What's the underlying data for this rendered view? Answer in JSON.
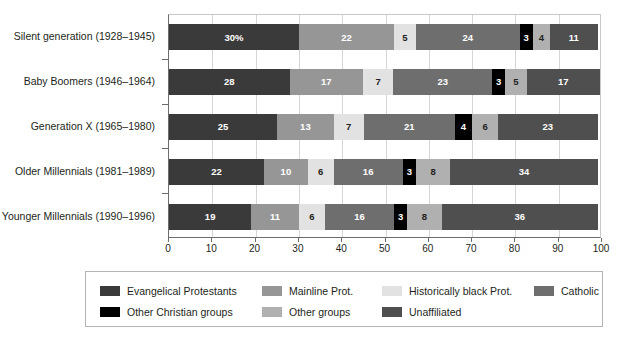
{
  "chart_data": {
    "type": "bar",
    "subtype": "horizontal-stacked-100",
    "title": "",
    "subtitle": "",
    "xlabel": "",
    "ylabel": "",
    "xlim": [
      0,
      100
    ],
    "xticks": [
      "0",
      "10",
      "20",
      "30",
      "40",
      "50",
      "60",
      "70",
      "80",
      "90",
      "100"
    ],
    "xtick_step": 10,
    "grid": true,
    "grid_axis": "x",
    "legend_position": "bottom",
    "categories": [
      "Silent generation (1928–1945)",
      "Baby Boomers (1946–1964)",
      "Generation X (1965–1980)",
      "Older Millennials (1981–1989)",
      "Younger Millennials (1990–1996)"
    ],
    "series": [
      {
        "name": "Evangelical Protestants",
        "color": "#3a3a3a",
        "label_color": "#ffffff",
        "values": [
          30,
          28,
          25,
          22,
          19
        ],
        "labels": [
          "30%",
          "28",
          "25",
          "22",
          "19"
        ]
      },
      {
        "name": "Mainline Prot.",
        "color": "#969696",
        "label_color": "#ffffff",
        "values": [
          22,
          17,
          13,
          10,
          11
        ],
        "labels": [
          "22",
          "17",
          "13",
          "10",
          "11"
        ]
      },
      {
        "name": "Historically black Prot.",
        "color": "#e2e2e2",
        "label_color": "#231f20",
        "values": [
          5,
          7,
          7,
          6,
          6
        ],
        "labels": [
          "5",
          "7",
          "7",
          "6",
          "6"
        ]
      },
      {
        "name": "Catholic",
        "color": "#6e6e6e",
        "label_color": "#ffffff",
        "values": [
          24,
          23,
          21,
          16,
          16
        ],
        "labels": [
          "24",
          "23",
          "21",
          "16",
          "16"
        ]
      },
      {
        "name": "Other Christian groups",
        "color": "#000000",
        "label_color": "#ffffff",
        "values": [
          3,
          3,
          4,
          3,
          3
        ],
        "labels": [
          "3",
          "3",
          "4",
          "3",
          "3"
        ]
      },
      {
        "name": "Other groups",
        "color": "#b0b0b0",
        "label_color": "#231f20",
        "values": [
          4,
          5,
          6,
          8,
          8
        ],
        "labels": [
          "4",
          "5",
          "6",
          "8",
          "8"
        ]
      },
      {
        "name": "Unaffiliated",
        "color": "#4f4f4f",
        "label_color": "#ffffff",
        "values": [
          11,
          17,
          23,
          34,
          36
        ],
        "labels": [
          "11",
          "17",
          "23",
          "34",
          "36"
        ]
      }
    ]
  },
  "legend": {
    "rows": [
      [
        {
          "label": "Evangelical Protestants",
          "color": "#3a3a3a"
        },
        {
          "label": "Mainline Prot.",
          "color": "#969696"
        },
        {
          "label": "Historically black Prot.",
          "color": "#e2e2e2"
        },
        {
          "label": "Catholic",
          "color": "#6e6e6e"
        }
      ],
      [
        {
          "label": "Other Christian groups",
          "color": "#000000"
        },
        {
          "label": "Other groups",
          "color": "#b0b0b0"
        },
        {
          "label": "Unaffiliated",
          "color": "#4f4f4f"
        }
      ]
    ]
  }
}
